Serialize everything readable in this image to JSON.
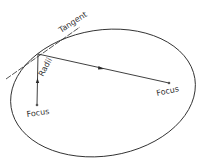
{
  "diagram": {
    "type": "ellipse-reflection",
    "labels": {
      "tangent": "Tangent",
      "radii": "Radii",
      "focus_left": "Focus",
      "focus_right": "Focus"
    },
    "colors": {
      "stroke": "#2a2a2a",
      "text": "#333333",
      "background": "#ffffff"
    }
  }
}
